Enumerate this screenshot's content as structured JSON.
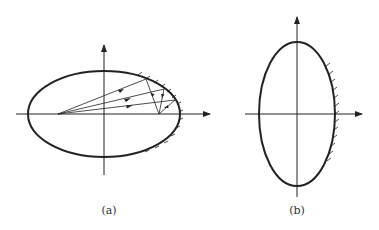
{
  "figures": [
    {
      "id": "a",
      "caption": "(a)",
      "description": "Horizontal ellipse with rays from left focus reflecting to right focus"
    },
    {
      "id": "b",
      "caption": "(b)",
      "description": "Vertical ellipse with hatched right boundary"
    }
  ],
  "colors": {
    "stroke": "#222222",
    "background": "#ffffff"
  }
}
